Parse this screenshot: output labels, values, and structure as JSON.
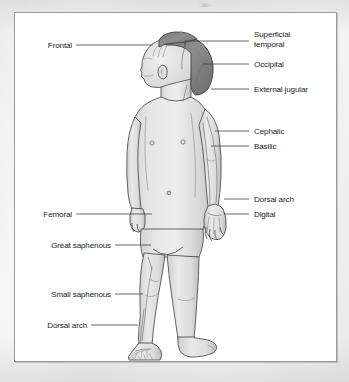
{
  "figure": {
    "colors": {
      "page_background": "#f2f2f2",
      "frame_background": "#ffffff",
      "frame_border": "#9a9a9c",
      "hair": "#8a8a8a",
      "skin": "#e2e2e2",
      "skin_shadow": "#c4c4c4",
      "outline": "#4a4a4a",
      "vein_line": "#6d6d6d",
      "leader_line": "#3a3a3a",
      "label_text": "#1d1d1d"
    }
  },
  "labels_right": [
    {
      "id": "superficial-temporal",
      "text_line1": "Superficial",
      "text_line2": "temporal",
      "text": "Superficial temporal"
    },
    {
      "id": "occipital",
      "text": "Occipital"
    },
    {
      "id": "external-jugular",
      "text": "External jugular"
    },
    {
      "id": "cephalic",
      "text": "Cephalic"
    },
    {
      "id": "basilic",
      "text": "Basilic"
    },
    {
      "id": "dorsal-arch-hand",
      "text": "Dorsal arch"
    },
    {
      "id": "digital",
      "text": "Digital"
    }
  ],
  "labels_left": [
    {
      "id": "frontal",
      "text": "Frontal"
    },
    {
      "id": "femoral",
      "text": "Femoral"
    },
    {
      "id": "great-saphenous",
      "text": "Great saphenous"
    },
    {
      "id": "small-saphenous",
      "text": "Small saphenous"
    },
    {
      "id": "dorsal-arch-foot",
      "text": "Dorsal arch"
    }
  ]
}
